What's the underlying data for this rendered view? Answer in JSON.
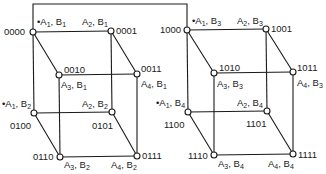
{
  "diagram": {
    "type": "hypercube-state-diagram",
    "stroke_color": "#1a1a1a",
    "background": "#ffffff",
    "connector": {
      "from": "0000",
      "to": "1000",
      "path": [
        [
          33,
          32
        ],
        [
          33,
          4
        ],
        [
          187,
          4
        ],
        [
          187,
          30
        ]
      ]
    },
    "cubes": [
      {
        "name": "left-cube",
        "nodes": [
          {
            "id": "0000",
            "x": 33,
            "y": 32,
            "state": "A1, B1",
            "a": "1",
            "b": "1",
            "marked": true
          },
          {
            "id": "0001",
            "x": 111,
            "y": 31,
            "state": "A2, B1",
            "a": "2",
            "b": "1",
            "marked": false
          },
          {
            "id": "0010",
            "x": 59,
            "y": 75,
            "state": "A3, B1",
            "a": "3",
            "b": "1",
            "marked": false
          },
          {
            "id": "0011",
            "x": 137,
            "y": 74,
            "state": "A4, B1",
            "a": "4",
            "b": "1",
            "marked": false
          },
          {
            "id": "0100",
            "x": 34,
            "y": 113,
            "state": "A1, B2",
            "a": "1",
            "b": "2",
            "marked": true
          },
          {
            "id": "0101",
            "x": 112,
            "y": 112,
            "state": "A2, B2",
            "a": "2",
            "b": "2",
            "marked": false
          },
          {
            "id": "0110",
            "x": 60,
            "y": 157,
            "state": "A3, B2",
            "a": "3",
            "b": "2",
            "marked": false
          },
          {
            "id": "0111",
            "x": 137,
            "y": 156,
            "state": "A4, B2",
            "a": "4",
            "b": "2",
            "marked": false
          }
        ]
      },
      {
        "name": "right-cube",
        "nodes": [
          {
            "id": "1000",
            "x": 187,
            "y": 30,
            "state": "A1, B3",
            "a": "1",
            "b": "3",
            "marked": true
          },
          {
            "id": "1001",
            "x": 266,
            "y": 29,
            "state": "A2, B3",
            "a": "2",
            "b": "3",
            "marked": false
          },
          {
            "id": "1010",
            "x": 214,
            "y": 73,
            "state": "A3, B3",
            "a": "3",
            "b": "3",
            "marked": false
          },
          {
            "id": "1011",
            "x": 293,
            "y": 72,
            "state": "A4, B3",
            "a": "4",
            "b": "3",
            "marked": false
          },
          {
            "id": "1100",
            "x": 188,
            "y": 112,
            "state": "A1, B4",
            "a": "1",
            "b": "4",
            "marked": true
          },
          {
            "id": "1101",
            "x": 267,
            "y": 111,
            "state": "A2, B4",
            "a": "2",
            "b": "4",
            "marked": false
          },
          {
            "id": "1110",
            "x": 214,
            "y": 155,
            "state": "A3, B4",
            "a": "3",
            "b": "4",
            "marked": false
          },
          {
            "id": "1111",
            "x": 293,
            "y": 154,
            "state": "A4, B4",
            "a": "4",
            "b": "4",
            "marked": false
          }
        ]
      }
    ],
    "labels": {
      "marker": "•",
      "A": "A",
      "B": "B",
      "sep": ", "
    }
  }
}
